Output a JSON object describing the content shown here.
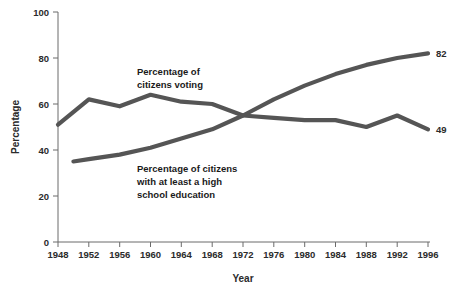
{
  "chart_data": {
    "type": "line",
    "title": "",
    "xlabel": "Year",
    "ylabel": "Percentage",
    "xlim": [
      1948,
      1996
    ],
    "ylim": [
      0,
      100
    ],
    "xticks": [
      1948,
      1952,
      1956,
      1960,
      1964,
      1968,
      1972,
      1976,
      1980,
      1984,
      1988,
      1992,
      1996
    ],
    "yticks": [
      0,
      20,
      40,
      60,
      80,
      100
    ],
    "xtick_labels": [
      "1948",
      "1952",
      "1956",
      "1960",
      "1964",
      "1968",
      "1972",
      "1976",
      "1980",
      "1984",
      "1988",
      "1992",
      "1996"
    ],
    "ytick_labels": [
      "0",
      "20",
      "40",
      "60",
      "80",
      "100"
    ],
    "grid": false,
    "legend": "inline-annotations",
    "line_color": "#555555",
    "series": [
      {
        "name": "Percentage of citizens voting",
        "color": "#555555",
        "x": [
          1948,
          1952,
          1956,
          1960,
          1964,
          1968,
          1972,
          1976,
          1980,
          1984,
          1988,
          1992,
          1996
        ],
        "values": [
          51,
          62,
          59,
          64,
          61,
          60,
          55,
          54,
          53,
          53,
          50,
          55,
          49
        ],
        "end_label": "49"
      },
      {
        "name": "Percentage of citizens with at least a high school education",
        "color": "#555555",
        "x": [
          1950,
          1952,
          1956,
          1960,
          1964,
          1968,
          1972,
          1976,
          1980,
          1984,
          1988,
          1992,
          1996
        ],
        "values": [
          35,
          36,
          38,
          41,
          45,
          49,
          55,
          62,
          68,
          73,
          77,
          80,
          82
        ],
        "end_label": "82"
      }
    ],
    "annotations": [
      {
        "id": "voting-annotation",
        "lines": [
          "Percentage of",
          "citizens voting"
        ],
        "x": 1957,
        "y": 72
      },
      {
        "id": "education-annotation",
        "lines": [
          "Percentage of citizens",
          "with at least a high",
          "school education"
        ],
        "x": 1957,
        "y": 39
      }
    ]
  }
}
